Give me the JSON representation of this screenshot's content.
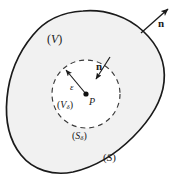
{
  "figure": {
    "background_color": "#ffffff",
    "outline_color": "#1a1a1a",
    "fill_color": "#f0f0f0",
    "dashed_color": "#3a3a3a",
    "width": 176,
    "height": 181
  },
  "labels": {
    "outer_volume": {
      "open": "(",
      "symbol": "V",
      "sub": "",
      "close": ")"
    },
    "inner_volume": {
      "open": "(",
      "symbol": "V",
      "sub": "δ",
      "close": ")"
    },
    "inner_surface": {
      "open": "(",
      "symbol": "S",
      "sub": "δ",
      "close": ")"
    },
    "outer_surface": {
      "open": "(",
      "symbol": "S",
      "sub": "",
      "close": ")"
    },
    "center_point": "P",
    "radius": "ε",
    "normal_outer": "n",
    "normal_inner": "n"
  },
  "elements": {
    "outer_boundary_name": "closed-surface-outline",
    "inner_boundary_name": "dashed-sphere-outline",
    "center_dot_name": "center-point-dot",
    "radius_arrow_name": "radius-arrow",
    "normal_outer_arrow_name": "outward-normal-arrow",
    "normal_inner_arrow_name": "inward-normal-arrow"
  }
}
